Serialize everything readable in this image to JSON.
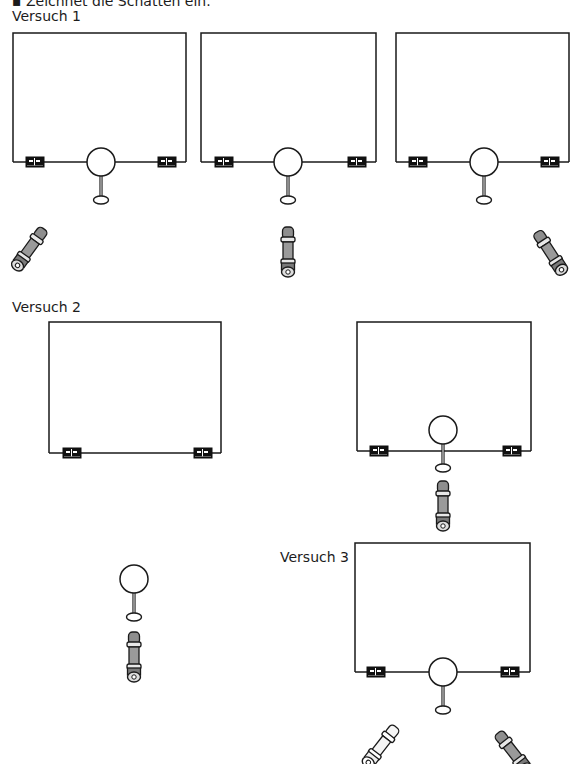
{
  "instruction": "▪ Zeichnet die Schatten ein.",
  "experiments": [
    {
      "label": "Versuch 1",
      "setups": [
        {
          "screen": "rectangle circuit screen",
          "ball": true,
          "flashlight": "bottom-left, pointing up-right",
          "flashlight_shade": "gray"
        },
        {
          "screen": "rectangle circuit screen",
          "ball": true,
          "flashlight": "bottom-center, pointing up",
          "flashlight_shade": "gray"
        },
        {
          "screen": "rectangle circuit screen",
          "ball": true,
          "flashlight": "bottom-right, pointing up-left",
          "flashlight_shade": "gray"
        }
      ]
    },
    {
      "label": "Versuch 2",
      "setups": [
        {
          "screen": "rectangle circuit screen",
          "ball": false,
          "flashlight": "none near screen"
        },
        {
          "screen": "rectangle circuit screen",
          "ball": true,
          "flashlight": "bottom-center, pointing up",
          "flashlight_shade": "gray"
        },
        {
          "screen": "none",
          "ball": true,
          "flashlight": "below ball, pointing up",
          "flashlight_shade": "gray"
        }
      ]
    },
    {
      "label": "Versuch 3",
      "setups": [
        {
          "screen": "rectangle circuit screen",
          "ball": true,
          "flashlights": [
            {
              "position": "bottom-left, pointing up-right",
              "shade": "white"
            },
            {
              "position": "bottom-right, pointing up-left",
              "shade": "gray"
            }
          ]
        }
      ]
    }
  ],
  "colors": {
    "line": "#1a1a1a",
    "clip": "#111111",
    "flashlight_gray": "#9a9a9a",
    "flashlight_white": "#f4f4f4",
    "background": "#ffffff"
  }
}
